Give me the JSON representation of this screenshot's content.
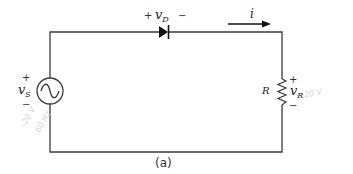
{
  "diagram": {
    "caption": "(a)",
    "source": {
      "symbol": "~",
      "label_main": "v",
      "label_sub": "S",
      "plus": "+",
      "minus": "−"
    },
    "diode": {
      "label_main": "v",
      "label_sub": "D",
      "plus": "+",
      "minus": "−"
    },
    "current": {
      "label": "i"
    },
    "resistor": {
      "name": "R",
      "label_main": "v",
      "label_sub": "R",
      "plus": "+",
      "minus": "−"
    },
    "annotations": {
      "right": "20 V",
      "left_line1": "-20 V",
      "left_line2": "60 Hz"
    },
    "colors": {
      "wire": "#3a3a3a",
      "text": "#222222",
      "annotation": "#d4d4d4"
    }
  }
}
